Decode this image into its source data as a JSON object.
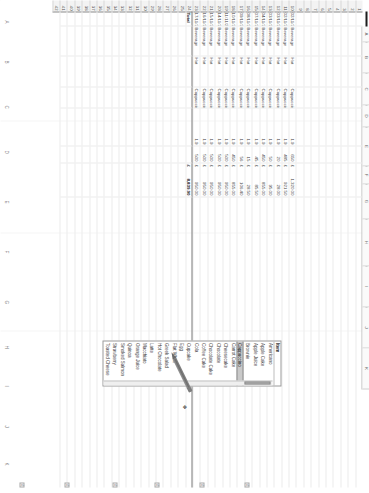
{
  "app": {
    "type": "spreadsheet",
    "orientation": "rotated-90-clockwise",
    "accent_color": "#c9c9c9",
    "grid_line_color": "#ececec"
  },
  "column_headers": [
    "A",
    "B",
    "C",
    "D",
    "E",
    "F",
    "G",
    "H",
    "I",
    "J",
    "K"
  ],
  "row_numbers": [
    "1",
    "2",
    "3",
    "4",
    "5",
    "6",
    "7",
    "8",
    "9",
    "10",
    "11",
    "12",
    "13",
    "14",
    "15",
    "16",
    "17",
    "18",
    "19",
    "20",
    "21",
    "22",
    "23",
    "24",
    "25",
    "26",
    "27",
    "28",
    "29",
    "30",
    "31",
    "32",
    "33",
    "34",
    "35",
    "36",
    "37",
    "38",
    "39",
    "40",
    "41",
    "42"
  ],
  "table": {
    "columns": [
      "Date",
      "Category",
      "Type",
      "Item",
      "Qty",
      "Amount"
    ],
    "rows": [
      {
        "row": "30",
        "date": "02/11/2016",
        "category": "Beverage",
        "type": "Hot",
        "item": "Cappuccino",
        "qty": "1.9",
        "amount_symbol": "£",
        "amount": "1,320.00",
        "count": "650"
      },
      {
        "row": "31",
        "date": "02/11/2016",
        "category": "Beverage",
        "type": "Hot",
        "item": "Cappuccino",
        "qty": "1.9",
        "amount_symbol": "£",
        "amount": "921.50",
        "count": "485"
      },
      {
        "row": "32",
        "date": "03/11/2016",
        "category": "Beverage",
        "type": "Hot",
        "item": "Cappuccino",
        "qty": "1.9",
        "amount_symbol": "£",
        "amount": "28.00",
        "count": "20"
      },
      {
        "row": "33",
        "date": "03/11/2016",
        "category": "Beverage",
        "type": "Hot",
        "item": "Cappuccino",
        "qty": "1.9",
        "amount_symbol": "£",
        "amount": "95.00",
        "count": "50"
      },
      {
        "row": "34",
        "date": "04/11/2016",
        "category": "Beverage",
        "type": "Hot",
        "item": "Cappuccino",
        "qty": "1.9",
        "amount_symbol": "£",
        "amount": "855.00",
        "count": "450"
      },
      {
        "row": "35",
        "date": "07/11/2016",
        "category": "Beverage",
        "type": "Hot",
        "item": "Cappuccino",
        "qty": "1.9",
        "amount_symbol": "£",
        "amount": "85.50",
        "count": "45"
      },
      {
        "row": "36",
        "date": "08/11/2016",
        "category": "Beverage",
        "type": "Hot",
        "item": "Cappuccino",
        "qty": "1.9",
        "amount_symbol": "£",
        "amount": "28.50",
        "count": "15"
      },
      {
        "row": "37",
        "date": "09/11/2016",
        "category": "Beverage",
        "type": "Hot",
        "item": "Cappuccino",
        "qty": "1.9",
        "amount_symbol": "£",
        "amount": "106.40",
        "count": "56"
      },
      {
        "row": "38",
        "date": "10/11/2016",
        "category": "Beverage",
        "type": "Hot",
        "item": "Cappuccino",
        "qty": "1.9",
        "amount_symbol": "£",
        "amount": "855.00",
        "count": "450"
      },
      {
        "row": "39",
        "date": "11/11/2016",
        "category": "Beverage",
        "type": "Hot",
        "item": "Cappuccino",
        "qty": "1.9",
        "amount_symbol": "£",
        "amount": "950.00",
        "count": "500"
      },
      {
        "row": "40",
        "date": "14/11/2016",
        "category": "Beverage",
        "type": "Hot",
        "item": "Cappuccino",
        "qty": "1.9",
        "amount_symbol": "£",
        "amount": "950.00",
        "count": "500"
      },
      {
        "row": "41",
        "date": "15/11/2016",
        "category": "Beverage",
        "type": "Hot",
        "item": "Cappuccino",
        "qty": "1.9",
        "amount_symbol": "£",
        "amount": "950.00",
        "count": "500"
      },
      {
        "row": "42",
        "date": "16/11/2016",
        "category": "Beverage",
        "type": "Hot",
        "item": "Cappuccino",
        "qty": "1.9",
        "amount_symbol": "£",
        "amount": "950.00",
        "count": "500"
      },
      {
        "row": "43",
        "date": "17/11/2016",
        "category": "Beverage",
        "type": "Hot",
        "item": "Cappuccino",
        "qty": "1.9",
        "amount_symbol": "£",
        "amount": "950.00",
        "count": "500"
      }
    ],
    "total_label": "Total",
    "total_symbol": "£",
    "total_value": "8,839.90"
  },
  "dropdown": {
    "header": "Item",
    "selected": "Cappuccino",
    "items": [
      "Americano",
      "Apple Cake",
      "Apple Juice",
      "Brownie",
      "Cappuccino",
      "Carrot Cake",
      "Cheesecake",
      "Chocolate",
      "Chocolate Cake",
      "Coffee Cake",
      "Cola",
      "Cupcake",
      "Egg",
      "Flat White",
      "Greek Salad",
      "Hot Chocolate",
      "Latte",
      "Macchiato",
      "Orange Juice",
      "Quinoa",
      "Smoked Salmon",
      "Strawberry",
      "Toasted Cheese"
    ]
  },
  "chrome": {
    "side_letters": [
      "A",
      "B",
      "C",
      "D",
      "E",
      "F",
      "G",
      "H",
      "I",
      "J",
      "K"
    ],
    "mini_buttons": [
      "4",
      "4",
      "4",
      "4",
      "4",
      "4"
    ],
    "cursor_glyph": "✥"
  },
  "annotation": {
    "pencil": "pencil-drawn-on-scan"
  }
}
